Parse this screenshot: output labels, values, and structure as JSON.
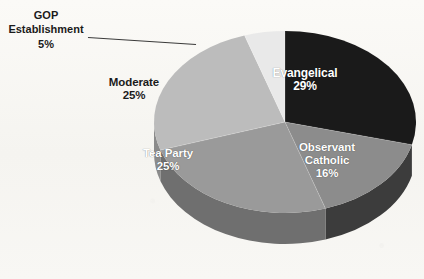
{
  "chart_data": {
    "type": "pie",
    "title": "",
    "subtitle": "",
    "xlabel": "",
    "ylabel": "",
    "legend_position": "none",
    "grid": false,
    "style": "3d-exploded-none",
    "value_suffix": "%",
    "categories": [
      "Evangelical",
      "Observant Catholic",
      "Tea Party",
      "Moderate",
      "GOP Establishment"
    ],
    "values": [
      29,
      16,
      25,
      25,
      5
    ],
    "labels": [
      "29%",
      "16%",
      "25%",
      "25%",
      "5%"
    ],
    "colors": [
      "#1a1a1a",
      "#8c8c8c",
      "#9a9a9a",
      "#bcbcbc",
      "#e9e9e9"
    ],
    "slices": [
      {
        "name": "Evangelical",
        "value": 29,
        "value_label": "29%",
        "color": "#1a1a1a",
        "side_color": "#0d0d0d",
        "label_placement": "inside",
        "label_color": "#ffffff"
      },
      {
        "name_line1": "Observant",
        "name_line2": "Catholic",
        "name": "Observant Catholic",
        "value": 16,
        "value_label": "16%",
        "color": "#8c8c8c",
        "side_color": "#3c3c3c",
        "label_placement": "inside",
        "label_color": "#ffffff"
      },
      {
        "name": "Tea Party",
        "value": 25,
        "value_label": "25%",
        "color": "#9a9a9a",
        "side_color": "#6f6f6f",
        "label_placement": "inside",
        "label_color": "#ffffff"
      },
      {
        "name": "Moderate",
        "value": 25,
        "value_label": "25%",
        "color": "#bcbcbc",
        "side_color": "#8b8b8b",
        "label_placement": "inside",
        "label_color": "#1b1b1b"
      },
      {
        "name_line1": "GOP",
        "name_line2": "Establishment",
        "name": "GOP Establishment",
        "value": 5,
        "value_label": "5%",
        "color": "#e9e9e9",
        "side_color": "#c2c2c2",
        "label_placement": "callout",
        "label_color": "#1b1b1b"
      }
    ],
    "background_color": "#f7f6f2",
    "leader_line_color": "#3a3a3a"
  },
  "callout": {
    "line1": "GOP",
    "line2": "Establishment",
    "line3": "5%"
  },
  "labels": {
    "evangelical_name": "Evangelical",
    "evangelical_value": "29%",
    "observant_name_1": "Observant",
    "observant_name_2": "Catholic",
    "observant_value": "16%",
    "teaparty_name": "Tea Party",
    "teaparty_value": "25%",
    "moderate_name": "Moderate",
    "moderate_value": "25%"
  }
}
